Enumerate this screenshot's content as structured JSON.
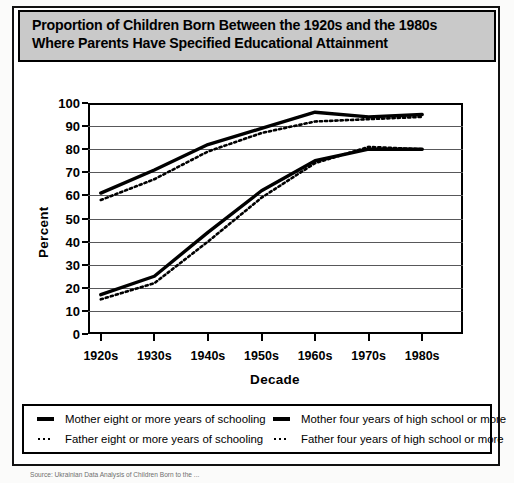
{
  "title": {
    "line1": "Proportion of Children Born Between the 1920s and the 1980s",
    "line2": "Where Parents Have Specified Educational Attainment",
    "full": "Proportion of Children Born Between the 1920s and the 1980s Where Parents Have Specified Educational Attainment"
  },
  "source": {
    "text": "Source: Ukrainian Data Analysis of Children Born to the ..."
  },
  "legend": {
    "entries": [
      {
        "label": "Mother eight or more years of schooling",
        "style": "solid"
      },
      {
        "label": "Mother four years of high school or more",
        "style": "solid"
      },
      {
        "label": "Father eight or more years of schooling",
        "style": "dotted"
      },
      {
        "label": "Father four years of high school or more",
        "style": "dotted"
      }
    ]
  },
  "colors": {
    "line": "#000000",
    "grid": "#58585a",
    "frame": "#000000",
    "title_background": "#c9c9c9",
    "page_background": "#ffffff"
  },
  "chart_data": {
    "type": "line",
    "title": "Proportion of Children Born Between the 1920s and the 1980s Where Parents Have Specified Educational Attainment",
    "xlabel": "Decade",
    "ylabel": "Percent",
    "categories": [
      "1920s",
      "1930s",
      "1940s",
      "1950s",
      "1960s",
      "1970s",
      "1980s"
    ],
    "ytick_labels": [
      "0",
      "10",
      "20",
      "30",
      "40",
      "50",
      "60",
      "70",
      "80",
      "90",
      "100"
    ],
    "ylim": [
      0,
      100
    ],
    "ytick_step": 10,
    "grid": true,
    "legend_position": "bottom",
    "series": [
      {
        "name": "Mother eight or more years of schooling",
        "style": "solid",
        "values": [
          61,
          71,
          82,
          89,
          96,
          94,
          95
        ]
      },
      {
        "name": "Father eight or more years of schooling",
        "style": "dotted",
        "values": [
          58,
          67,
          79,
          87,
          92,
          93,
          94
        ]
      },
      {
        "name": "Mother four years of high school or more",
        "style": "solid",
        "values": [
          17,
          25,
          44,
          62,
          75,
          80,
          80
        ]
      },
      {
        "name": "Father four years of high school or more",
        "style": "dotted",
        "values": [
          15,
          22,
          40,
          59,
          74,
          81,
          80
        ]
      }
    ]
  }
}
